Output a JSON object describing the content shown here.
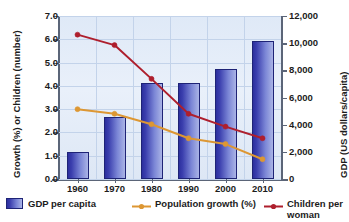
{
  "chart_data": {
    "type": "bar",
    "title": "",
    "subtitle": "",
    "categories": [
      "1960",
      "1970",
      "1980",
      "1990",
      "2000",
      "2010"
    ],
    "xlabel": "",
    "grid": true,
    "legend_position": "bottom",
    "axes": {
      "left": {
        "label": "Growth (%) or Children (number)",
        "ticks": [
          "0.0",
          "1.0",
          "2.0",
          "3.0",
          "4.0",
          "5.0",
          "6.0",
          "7.0"
        ],
        "min": 0,
        "max": 7,
        "step": 1
      },
      "right": {
        "label": "GDP (US dollars/capita)",
        "ticks": [
          "0",
          "2,000",
          "4,000",
          "6,000",
          "8,000",
          "10,000",
          "12,000"
        ],
        "min": 0,
        "max": 12000,
        "step": 2000
      }
    },
    "series": [
      {
        "name": "GDP per capita",
        "type": "bar",
        "axis": "right",
        "color": "#3b3fae",
        "unit": "US dollars/capita",
        "values": [
          2000,
          4550,
          7100,
          7100,
          8100,
          10150
        ]
      },
      {
        "name": "Population growth (%)",
        "type": "line",
        "axis": "left",
        "color": "#dd9733",
        "unit": "%",
        "values": [
          3.0,
          2.8,
          2.35,
          1.75,
          1.5,
          0.85
        ]
      },
      {
        "name": "Children per woman",
        "type": "line",
        "axis": "left",
        "color": "#ae1f2d",
        "unit": "number",
        "values": [
          6.2,
          5.75,
          4.3,
          2.8,
          2.25,
          1.75
        ]
      }
    ]
  },
  "legend": {
    "items": [
      {
        "label": "GDP per capita",
        "marker": "bar-swatch",
        "color": "#3b3fae"
      },
      {
        "label": "Population growth (%)",
        "marker": "line-marker",
        "color": "#dd9733"
      },
      {
        "label": "Children per\nwoman",
        "marker": "line-marker",
        "color": "#ae1f2d"
      }
    ]
  }
}
